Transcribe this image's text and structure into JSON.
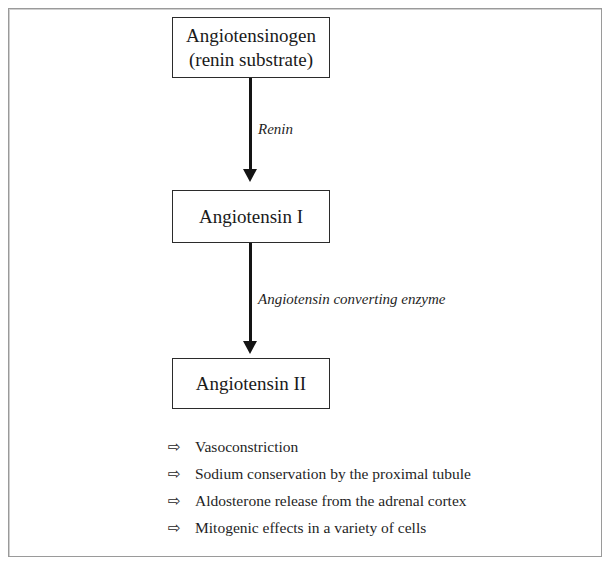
{
  "diagram": {
    "nodes": [
      {
        "id": "angiotensinogen",
        "lines": [
          "Angiotensinogen",
          "(renin substrate)"
        ]
      },
      {
        "id": "angiotensin-1",
        "lines": [
          "Angiotensin I"
        ]
      },
      {
        "id": "angiotensin-2",
        "lines": [
          "Angiotensin II"
        ]
      }
    ],
    "arrows": [
      {
        "id": "arrow-1",
        "label": "Renin"
      },
      {
        "id": "arrow-2",
        "label": "Angiotensin converting enzyme"
      }
    ],
    "effects": {
      "bullet_glyph": "⇨",
      "items": [
        "Vasoconstriction",
        "Sodium conservation by the proximal tubule",
        "Aldosterone release from the adrenal cortex",
        "Mitogenic effects in a variety of cells"
      ]
    }
  }
}
